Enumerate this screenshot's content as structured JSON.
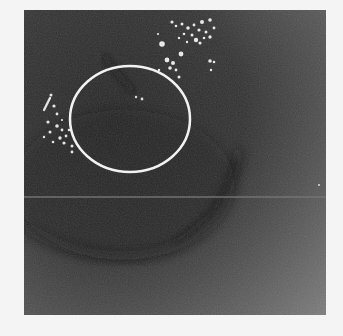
{
  "image": {
    "description": "Grayscale medical/scientific image with a white elliptical region-of-interest annotation",
    "frame": {
      "x": 24,
      "y": 10,
      "width": 302,
      "height": 305
    },
    "colors": {
      "page_background": "#f4f4f4",
      "image_dark": "#2a2a2a",
      "image_mid": "#4a4a4a",
      "image_light": "#6e6e6e",
      "annotation": "#f2f2f2",
      "artifact_line": "#707070"
    },
    "annotation": {
      "shape": "ellipse",
      "cx": 106,
      "cy": 109,
      "rx": 60,
      "ry": 53,
      "stroke_width": 2.5
    },
    "artifact_line_y": 187
  }
}
